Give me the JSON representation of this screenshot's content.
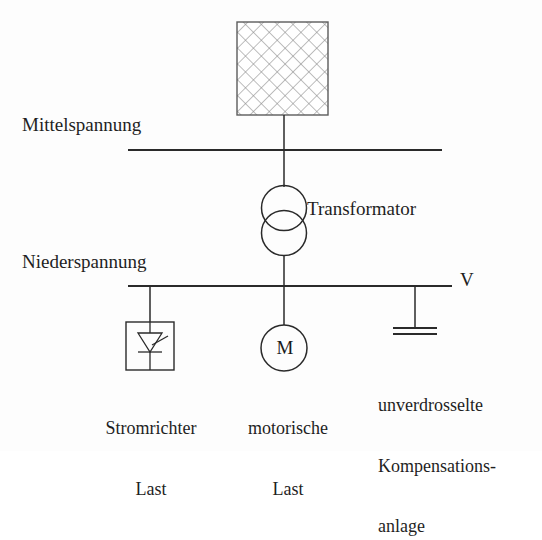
{
  "diagram": {
    "language": "de",
    "background_color": "#fdfdfd",
    "line_color": "#2a2a2a",
    "text_color": "#1f1f1f"
  },
  "labels": {
    "medium_voltage": "Mittelspannung",
    "low_voltage": "Niederspannung",
    "transformer": "Transformator",
    "measurement_point": "V",
    "motor_symbol": "M"
  },
  "loads": [
    {
      "name": "converter-load",
      "symbol": "thyristor",
      "label_lines": [
        "Stromrichter",
        "Last"
      ]
    },
    {
      "name": "motor-load",
      "symbol": "motor",
      "label_lines": [
        "motorische",
        "Last"
      ]
    },
    {
      "name": "capacitor-bank",
      "symbol": "capacitor",
      "label_lines": [
        "unverdrosselte",
        "Kompensations-",
        "anlage"
      ]
    }
  ],
  "source": {
    "name": "network-source",
    "symbol": "cross-hatched-box"
  }
}
